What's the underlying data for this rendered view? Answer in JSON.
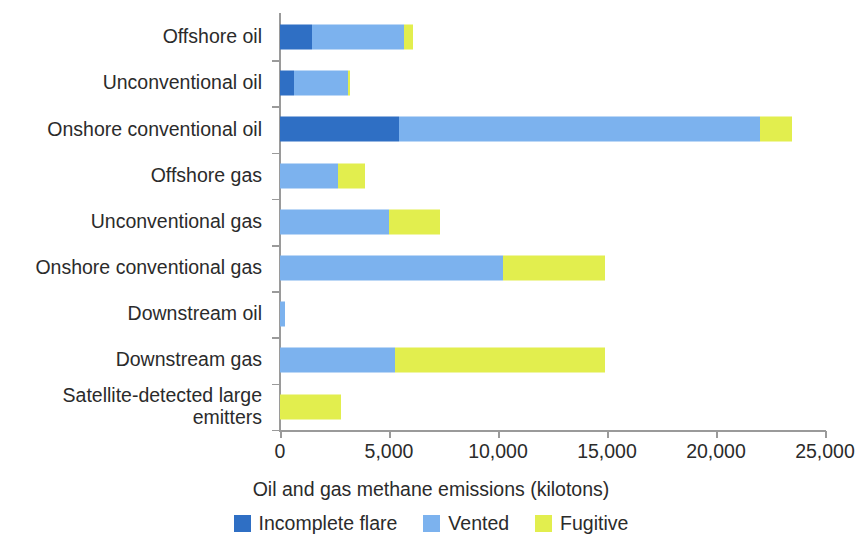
{
  "chart_data": {
    "type": "bar",
    "orientation": "horizontal",
    "stacked": true,
    "title": "",
    "xlabel": "Oil and gas methane emissions (kilotons)",
    "ylabel": "",
    "xlim": [
      0,
      25000
    ],
    "xticks": [
      0,
      5000,
      10000,
      15000,
      20000,
      25000
    ],
    "xtick_labels": [
      "0",
      "5,000",
      "10,000",
      "15,000",
      "20,000",
      "25,000"
    ],
    "grid": false,
    "legend_position": "bottom",
    "categories": [
      "Offshore oil",
      "Unconventional oil",
      "Onshore conventional oil",
      "Offshore gas",
      "Unconventional gas",
      "Onshore conventional gas",
      "Downstream oil",
      "Downstream gas",
      "Satellite-detected large\nemitters"
    ],
    "series": [
      {
        "name": "Incomplete flare",
        "color": "#2f6fc4",
        "values": [
          1450,
          620,
          5450,
          0,
          0,
          0,
          0,
          0,
          0
        ]
      },
      {
        "name": "Vented",
        "color": "#7cb2ee",
        "values": [
          4250,
          2480,
          16550,
          2660,
          5000,
          10230,
          230,
          5270,
          0
        ]
      },
      {
        "name": "Fugitive",
        "color": "#e2ee4e",
        "values": [
          380,
          130,
          1500,
          1240,
          2340,
          4670,
          0,
          9630,
          2800
        ]
      }
    ],
    "totals": [
      6080,
      3230,
      23500,
      3900,
      7340,
      14900,
      230,
      14900,
      2800
    ]
  },
  "legend": {
    "items": [
      {
        "label": "Incomplete flare",
        "color": "#2f6fc4",
        "swatch": "legend-swatch-incomplete-flare"
      },
      {
        "label": "Vented",
        "color": "#7cb2ee",
        "swatch": "legend-swatch-vented"
      },
      {
        "label": "Fugitive",
        "color": "#e2ee4e",
        "swatch": "legend-swatch-fugitive"
      }
    ]
  }
}
